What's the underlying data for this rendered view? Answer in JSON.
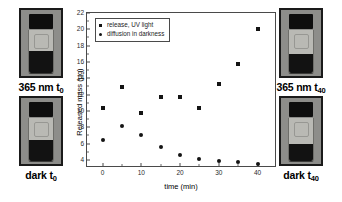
{
  "figure": {
    "panels": [
      {
        "name": "photo-365nm-t0",
        "caption_main": "365 nm t",
        "caption_sub": "0",
        "position": "top-left",
        "fill_ratio": 0.52
      },
      {
        "name": "photo-dark-t0",
        "caption_main": "dark t",
        "caption_sub": "0",
        "position": "bottom-left",
        "fill_ratio": 0.5
      },
      {
        "name": "photo-365nm-t40",
        "caption_main": "365 nm t",
        "caption_sub": "40",
        "position": "top-right",
        "fill_ratio": 0.44
      },
      {
        "name": "photo-dark-t40",
        "caption_main": "dark t",
        "caption_sub": "40",
        "position": "bottom-right",
        "fill_ratio": 0.4
      }
    ]
  },
  "chart_data": {
    "type": "scatter",
    "title": "",
    "xlabel": "time (min)",
    "ylabel": "Released mass (µg)",
    "xlim": [
      -4,
      45
    ],
    "ylim": [
      3,
      22
    ],
    "xticks": [
      0,
      10,
      20,
      30,
      40
    ],
    "xticks_minor": [
      5,
      15,
      25,
      35
    ],
    "yticks": [
      4,
      6,
      8,
      10,
      12,
      14,
      16,
      18,
      20,
      22
    ],
    "yticks_minor": [
      5,
      7,
      9,
      11,
      13,
      15,
      17,
      19,
      21
    ],
    "grid": false,
    "legend_position": "top-left",
    "x": [
      0,
      5,
      10,
      15,
      20,
      25,
      30,
      35,
      40
    ],
    "series": [
      {
        "name": "release, UV light",
        "marker": "square",
        "color": "#141414",
        "values": [
          10.3,
          12.9,
          9.8,
          11.7,
          11.65,
          10.4,
          13.3,
          15.7,
          20.1
        ]
      },
      {
        "name": "diffusion in darkness",
        "marker": "circle",
        "color": "#141414",
        "values": [
          6.4,
          8.1,
          7.1,
          5.6,
          4.6,
          4.15,
          3.85,
          3.7,
          3.55
        ]
      }
    ]
  }
}
